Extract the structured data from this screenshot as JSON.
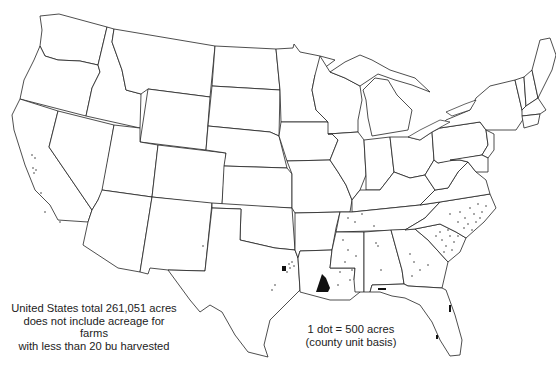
{
  "map": {
    "title": "",
    "subject": "Dot density map of harvested acreage by county, United States",
    "notes": {
      "total": {
        "line1": "United States total 261,051 acres",
        "line2": "does not include acreage for farms",
        "line3": "with less than 20 bu harvested"
      },
      "scale": {
        "line1": "1 dot = 500 acres",
        "line2": "(county unit basis)"
      }
    },
    "dot_value_acres": 500,
    "us_total_acres": 261051,
    "concentrations": [
      {
        "region": "Southwest Louisiana",
        "density": "very high"
      },
      {
        "region": "East-central Texas",
        "density": "high"
      },
      {
        "region": "Eastern North Carolina",
        "density": "moderate"
      },
      {
        "region": "South Carolina",
        "density": "moderate"
      },
      {
        "region": "Mississippi",
        "density": "low-moderate"
      },
      {
        "region": "Georgia",
        "density": "low"
      },
      {
        "region": "Tennessee",
        "density": "low"
      },
      {
        "region": "Alabama",
        "density": "low"
      },
      {
        "region": "Florida (east coast, panhandle)",
        "density": "low"
      },
      {
        "region": "Central California",
        "density": "low"
      }
    ],
    "colors": {
      "outline": "#222222",
      "dot": "#111111",
      "background": "#ffffff"
    }
  }
}
